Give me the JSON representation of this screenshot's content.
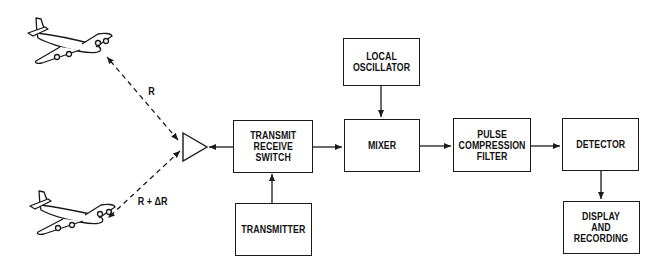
{
  "diagram": {
    "type": "block-diagram",
    "blocks": {
      "transmit_receive_switch": {
        "label": "TRANSMIT\nRECEIVE\nSWITCH"
      },
      "transmitter": {
        "label": "TRANSMITTER"
      },
      "local_oscillator": {
        "label": "LOCAL\nOSCILLATOR"
      },
      "mixer": {
        "label": "MIXER"
      },
      "pulse_compression_filter": {
        "label": "PULSE\nCOMPRESSION\nFILTER"
      },
      "detector": {
        "label": "DETECTOR"
      },
      "display_recording": {
        "label": "DISPLAY\nAND\nRECORDING"
      }
    },
    "targets": [
      {
        "name": "aircraft-1",
        "range_label": "R"
      },
      {
        "name": "aircraft-2",
        "range_label": "R + ΔR"
      }
    ],
    "antenna": {
      "shape": "triangle"
    },
    "connections": [
      [
        "transmit_receive_switch",
        "antenna"
      ],
      [
        "transmitter",
        "transmit_receive_switch"
      ],
      [
        "transmit_receive_switch",
        "mixer"
      ],
      [
        "local_oscillator",
        "mixer"
      ],
      [
        "mixer",
        "pulse_compression_filter"
      ],
      [
        "pulse_compression_filter",
        "detector"
      ],
      [
        "detector",
        "display_recording"
      ],
      [
        "antenna",
        "aircraft-1"
      ],
      [
        "antenna",
        "aircraft-2"
      ]
    ],
    "colors": {
      "line": "#1a1a1a",
      "background": "#ffffff"
    }
  }
}
